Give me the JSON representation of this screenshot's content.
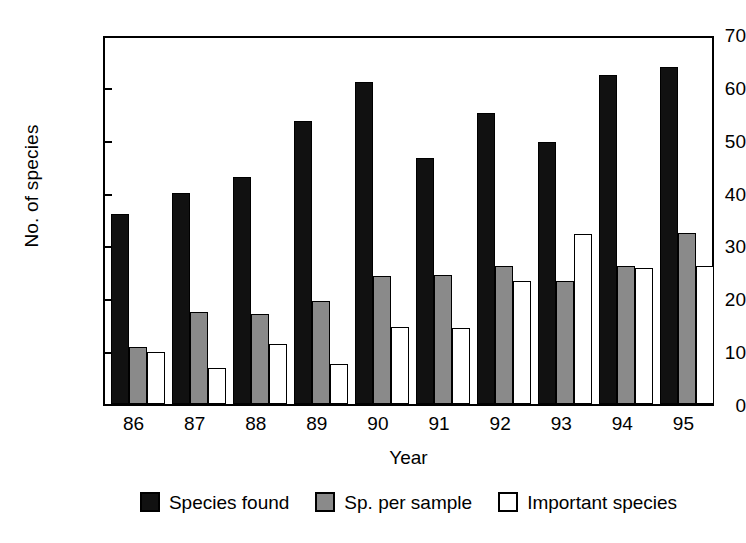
{
  "chart_data": {
    "type": "bar",
    "title": "",
    "xlabel": "Year",
    "ylabel": "No. of species",
    "categories": [
      "86",
      "87",
      "88",
      "89",
      "90",
      "91",
      "92",
      "93",
      "94",
      "95"
    ],
    "series": [
      {
        "name": "Species found",
        "color": "#111111",
        "values": [
          36.0,
          40.0,
          43.0,
          53.5,
          61.0,
          46.5,
          55.0,
          49.5,
          62.3,
          63.8
        ]
      },
      {
        "name": "Sp. per sample",
        "color": "#8a8a8a",
        "values": [
          10.8,
          17.5,
          17.0,
          19.5,
          24.3,
          24.5,
          26.2,
          23.3,
          26.2,
          32.3
        ]
      },
      {
        "name": "Important species",
        "color": "#ffffff",
        "values": [
          9.8,
          6.8,
          11.3,
          7.6,
          14.5,
          14.3,
          23.2,
          32.2,
          25.8,
          26.2
        ]
      }
    ],
    "ylim": [
      0,
      70
    ],
    "yticks": [
      0,
      10,
      20,
      30,
      40,
      50,
      60,
      70
    ],
    "ytick_labels": [
      "0",
      "10",
      "20",
      "30",
      "40",
      "50",
      "60",
      "70"
    ],
    "grid": false,
    "legend_position": "bottom-center"
  }
}
